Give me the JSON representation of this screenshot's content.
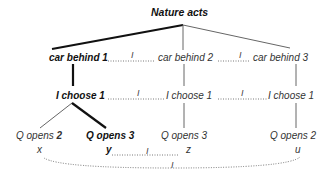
{
  "diagram": {
    "root": "Nature acts",
    "level1": [
      "car behind 1",
      "car behind 2",
      "car behind 3"
    ],
    "level2": [
      "I choose 1",
      "I choose 1",
      "I choose 1"
    ],
    "level3": [
      {
        "prefix": "Q opens ",
        "num": "2"
      },
      {
        "label": "Q opens 3"
      },
      {
        "label": "Q opens 3"
      },
      {
        "label": "Q opens 2"
      }
    ],
    "terminals": [
      "x",
      "y",
      "z",
      "u"
    ],
    "info_set_marker": "I"
  }
}
